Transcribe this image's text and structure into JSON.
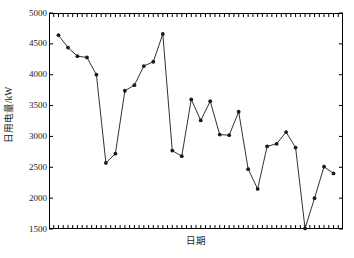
{
  "chart_data": {
    "type": "line",
    "title": "",
    "xlabel": "日期",
    "ylabel": "日用电量/kW",
    "ylim": [
      1500,
      5000
    ],
    "ytick_labels": [
      "5000",
      "4500",
      "4000",
      "3500",
      "3000",
      "2500",
      "2000",
      "1500"
    ],
    "yticks": [
      5000,
      4500,
      4000,
      3500,
      3000,
      2500,
      2000,
      1500
    ],
    "grid": false,
    "legend": "none",
    "marker": "filled-circle",
    "line_color": "#1a1a1a",
    "marker_color": "#1a1a1a",
    "xtick_labels": [],
    "x": [
      1,
      2,
      3,
      4,
      5,
      6,
      7,
      8,
      9,
      10,
      11,
      12,
      13,
      14,
      15,
      16,
      17,
      18,
      19,
      20,
      21,
      22,
      23,
      24,
      25,
      26,
      27,
      28,
      29,
      30
    ],
    "values": [
      4640,
      4440,
      4300,
      4280,
      4000,
      2570,
      2720,
      3740,
      3830,
      4140,
      4210,
      4660,
      2770,
      2680,
      3600,
      3260,
      3570,
      3030,
      3020,
      3400,
      2470,
      2150,
      2840,
      2880,
      3070,
      2820,
      1510,
      2000,
      2510,
      2400
    ],
    "series": [
      {
        "name": "日用电量",
        "values": [
          4640,
          4440,
          4300,
          4280,
          4000,
          2570,
          2720,
          3740,
          3830,
          4140,
          4210,
          4660,
          2770,
          2680,
          3600,
          3260,
          3570,
          3030,
          3020,
          3400,
          2470,
          2150,
          2840,
          2880,
          3070,
          2820,
          1510,
          2000,
          2510,
          2400
        ]
      }
    ]
  },
  "axes": {
    "y_title": "日用电量/kW",
    "x_title": "日期"
  }
}
